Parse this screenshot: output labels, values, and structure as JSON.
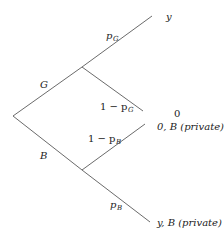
{
  "diagram": {
    "type": "decision-tree",
    "line_color": "#6b6b6b",
    "nodes": {
      "root": [
        13,
        116
      ],
      "G": [
        82,
        67
      ],
      "B": [
        82,
        170
      ]
    },
    "branches": {
      "G": {
        "label": "G"
      },
      "B": {
        "label": "B"
      },
      "pG": {
        "label_main": "p",
        "label_sub": "G"
      },
      "one_minus_pG": {
        "label_main": "1 − p",
        "label_sub": "G"
      },
      "one_minus_pB": {
        "label_main": "1 − p",
        "label_sub": "B"
      },
      "pB": {
        "label_main": "p",
        "label_sub": "B"
      }
    },
    "outcomes": {
      "top": "y",
      "middle_upper": "0",
      "middle_lower": "0, B (private)",
      "bottom": "y, B (private)"
    }
  }
}
